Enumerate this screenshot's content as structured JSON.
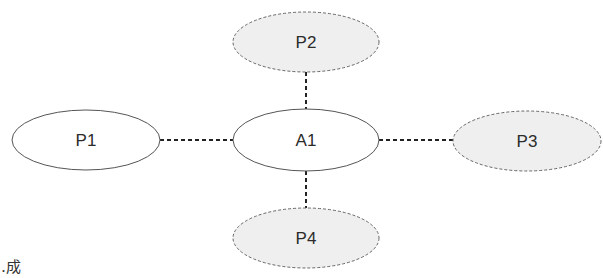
{
  "diagram": {
    "nodes": [
      {
        "id": "P1",
        "label": "P1",
        "cx": 86,
        "cy": 140,
        "rx": 74,
        "ry": 30,
        "style": "solid",
        "fill": "#ffffff"
      },
      {
        "id": "A1",
        "label": "A1",
        "cx": 306,
        "cy": 140,
        "rx": 73,
        "ry": 31,
        "style": "solid",
        "fill": "#ffffff"
      },
      {
        "id": "P2",
        "label": "P2",
        "cx": 306,
        "cy": 42,
        "rx": 73,
        "ry": 30,
        "style": "dashed",
        "fill": "#efefef"
      },
      {
        "id": "P3",
        "label": "P3",
        "cx": 527,
        "cy": 141,
        "rx": 74,
        "ry": 30,
        "style": "dashed",
        "fill": "#efefef"
      },
      {
        "id": "P4",
        "label": "P4",
        "cx": 306,
        "cy": 238,
        "rx": 73,
        "ry": 30,
        "style": "dashed",
        "fill": "#efefef"
      }
    ],
    "edges": [
      {
        "from": "P1",
        "to": "A1",
        "style": "dotted"
      },
      {
        "from": "A1",
        "to": "P2",
        "style": "dotted"
      },
      {
        "from": "A1",
        "to": "P3",
        "style": "dotted"
      },
      {
        "from": "A1",
        "to": "P4",
        "style": "dotted"
      }
    ],
    "colors": {
      "stroke": "#555555",
      "dashed_stroke": "#666666",
      "edge": "#222222",
      "text": "#2b2b2b"
    }
  },
  "caption_fragment": "…成"
}
